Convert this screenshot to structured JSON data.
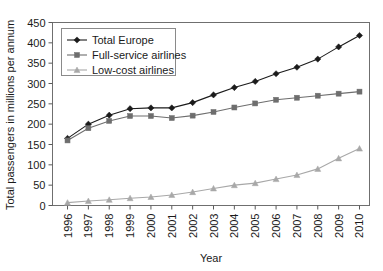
{
  "chart_data": {
    "type": "line",
    "title": "",
    "xlabel": "Year",
    "ylabel": "Total passengers in millions per annum",
    "categories": [
      "1996",
      "1997",
      "1998",
      "1999",
      "2000",
      "2001",
      "2002",
      "2003",
      "2004",
      "2005",
      "2006",
      "2007",
      "2008",
      "2009",
      "2010"
    ],
    "x": [
      1996,
      1997,
      1998,
      1999,
      2000,
      2001,
      2002,
      2003,
      2004,
      2005,
      2006,
      2007,
      2008,
      2009,
      2010
    ],
    "ylim": [
      0,
      450
    ],
    "yticks": [
      0,
      50,
      100,
      150,
      200,
      250,
      300,
      350,
      400,
      450
    ],
    "ytick_labels": [
      "0",
      "50",
      "100",
      "150",
      "200",
      "250",
      "300",
      "350",
      "400",
      "450"
    ],
    "grid": false,
    "legend_position": "upper-left",
    "series": [
      {
        "name": "Total Europe",
        "marker": "diamond",
        "color": "#1b1b1b",
        "values": [
          165,
          200,
          222,
          238,
          240,
          240,
          253,
          272,
          290,
          305,
          324,
          340,
          360,
          390,
          418
        ]
      },
      {
        "name": "Full-service airlines",
        "marker": "square",
        "color": "#6e6e6e",
        "values": [
          160,
          190,
          208,
          220,
          220,
          215,
          221,
          230,
          241,
          251,
          260,
          265,
          270,
          275,
          280
        ]
      },
      {
        "name": "Low-cost airlines",
        "marker": "triangle",
        "color": "#a8a8a8",
        "values": [
          7,
          11,
          14,
          18,
          21,
          26,
          33,
          42,
          50,
          55,
          65,
          75,
          90,
          116,
          140
        ]
      }
    ]
  },
  "axes": {
    "x_axis_title": "Year",
    "y_axis_title": "Total passengers in millions per annum"
  },
  "legend": {
    "entries": [
      {
        "label": "Total Europe"
      },
      {
        "label": "Full-service airlines"
      },
      {
        "label": "Low-cost airlines"
      }
    ]
  }
}
